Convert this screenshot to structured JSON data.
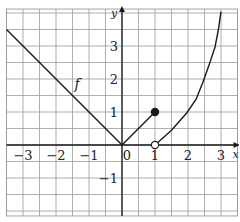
{
  "chart_data": {
    "type": "line",
    "title": "",
    "xlabel": "x",
    "ylabel": "y",
    "xlim": [
      -3.5,
      3.5
    ],
    "ylim": [
      -2.15,
      4.12
    ],
    "grid": true,
    "grid_step": 0.5,
    "x_ticks": [
      -3,
      -2,
      -1,
      0,
      1,
      2,
      3
    ],
    "x_tick_labels": [
      "−3",
      "−2",
      "−1",
      "0",
      "1",
      "2",
      "3"
    ],
    "y_ticks": [
      -1,
      1,
      2,
      3
    ],
    "y_tick_labels": [
      "−1",
      "1",
      "2",
      "3"
    ],
    "function_label": "f",
    "function_label_position": [
      -1.35,
      1.85
    ],
    "series": [
      {
        "name": "f (left piece, y = -x)",
        "points": [
          [
            -3.5,
            3.5
          ],
          [
            0,
            0
          ]
        ]
      },
      {
        "name": "f (middle piece, y = x)",
        "points": [
          [
            0,
            0
          ],
          [
            1,
            1
          ]
        ],
        "end_marker": {
          "point": [
            1,
            1
          ],
          "style": "closed"
        }
      },
      {
        "name": "f (right piece, increasing curve)",
        "points": [
          [
            1,
            0
          ],
          [
            1.5,
            0.45
          ],
          [
            1.96,
            0.97
          ],
          [
            2.25,
            1.4
          ],
          [
            2.46,
            1.92
          ],
          [
            2.65,
            2.45
          ],
          [
            2.82,
            2.98
          ],
          [
            2.92,
            3.5
          ],
          [
            3.0,
            4.04
          ]
        ],
        "start_marker": {
          "point": [
            1,
            0
          ],
          "style": "open"
        }
      }
    ],
    "colors": {
      "grid": "#9a9a9a",
      "axes": "#1a1a1a",
      "curve": "#1a1a1a",
      "background": "#ffffff"
    }
  }
}
